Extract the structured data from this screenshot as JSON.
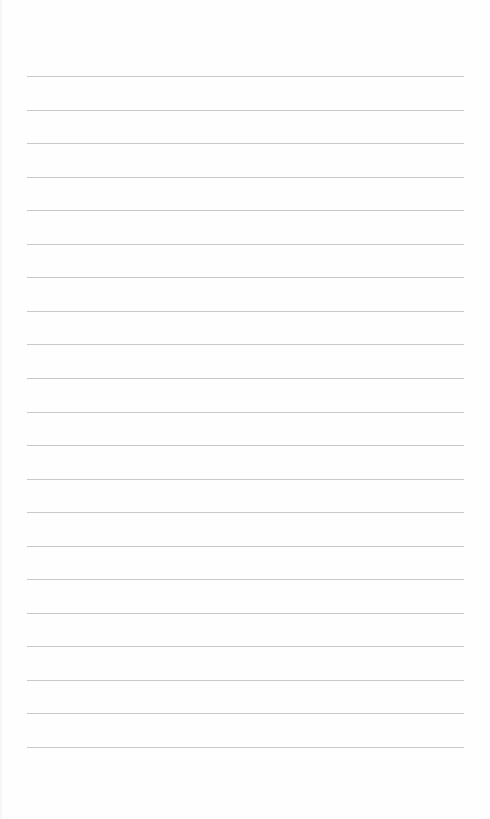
{
  "page": {
    "type": "lined-paper",
    "background_color": "#fefefe",
    "rule_color": "#c9c9c9",
    "rule_count": 21,
    "rules": [
      {
        "y": 76
      },
      {
        "y": 110
      },
      {
        "y": 143
      },
      {
        "y": 177
      },
      {
        "y": 210
      },
      {
        "y": 244
      },
      {
        "y": 277
      },
      {
        "y": 311
      },
      {
        "y": 344
      },
      {
        "y": 378
      },
      {
        "y": 412
      },
      {
        "y": 445
      },
      {
        "y": 479
      },
      {
        "y": 512
      },
      {
        "y": 546
      },
      {
        "y": 579
      },
      {
        "y": 613
      },
      {
        "y": 646
      },
      {
        "y": 680
      },
      {
        "y": 713
      },
      {
        "y": 747
      }
    ]
  }
}
